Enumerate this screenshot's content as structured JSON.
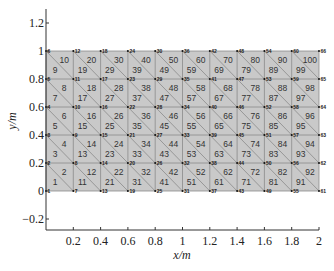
{
  "chart_data": {
    "type": "mesh",
    "title": "",
    "xlabel": "x/m",
    "ylabel": "y/m",
    "xlim": [
      0,
      2
    ],
    "ylim": [
      -0.3,
      1.3
    ],
    "xticks": [
      0.2,
      0.4,
      0.6,
      0.8,
      1,
      1.2,
      1.4,
      1.6,
      1.8,
      2
    ],
    "xtick_labels": [
      "0.2",
      "0.4",
      "0.6",
      "0.8",
      "1",
      "1.2",
      "1.4",
      "1.6",
      "1.8",
      "2"
    ],
    "yticks": [
      -0.2,
      0,
      0.2,
      0.4,
      0.6,
      0.8,
      1,
      1.2
    ],
    "ytick_labels": [
      "−0.2",
      "0",
      "0.2",
      "0.4",
      "0.6",
      "0.8",
      "1",
      "1.2"
    ],
    "mesh": {
      "domain": {
        "x": [
          0,
          2
        ],
        "y": [
          0,
          1
        ]
      },
      "columns": 10,
      "rows": 5,
      "node_count": 66,
      "element_count": 100,
      "element_type": "linear triangle",
      "diagonal": "top-left to bottom-right",
      "node_numbering": "column-wise, bottom to top, starting at (0,0)",
      "element_numbering": "per cell column-wise: lower-left triangle odd, upper-right triangle even",
      "fill_color": "#c9c9c9",
      "edge_color": "#8a8a8a",
      "node_marker_color": "#111111"
    },
    "grid": false,
    "legend": null
  },
  "axes": {
    "x_axis_label": "x/m",
    "y_axis_label": "y/m"
  },
  "colors": {
    "background": "#ffffff",
    "axis": "#333333",
    "mesh_fill": "#c9c9c9",
    "mesh_edge": "#8a8a8a"
  }
}
